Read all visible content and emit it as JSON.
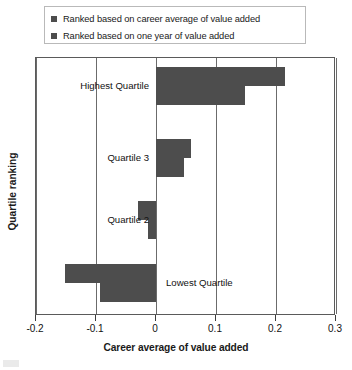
{
  "legend": {
    "items": [
      {
        "label": "Ranked based on career average of value added",
        "color": "#4d4d4d",
        "key": "career_average"
      },
      {
        "label": "Ranked based on one year of value added",
        "color": "#4d4d4d",
        "key": "one_year"
      }
    ]
  },
  "axes": {
    "x_title": "Career average of value added",
    "y_title": "Quartile ranking",
    "x_ticks": [
      "-0.2",
      "-0.1",
      "0",
      "0.1",
      "0.2",
      "0.3"
    ]
  },
  "chart_data": {
    "type": "bar",
    "orientation": "horizontal",
    "title": "",
    "xlabel": "Career average of value added",
    "ylabel": "Quartile ranking",
    "categories": [
      "Highest Quartile",
      "Quartile 3",
      "Quartile 2",
      "Lowest Quartile"
    ],
    "series": [
      {
        "name": "Ranked based on career average of value added",
        "color": "#4d4d4d",
        "values": [
          0.215,
          0.058,
          -0.03,
          -0.152
        ]
      },
      {
        "name": "Ranked based on one year of value added",
        "color": "#4d4d4d",
        "values": [
          0.148,
          0.047,
          -0.014,
          -0.094
        ]
      }
    ],
    "xlim": [
      -0.2,
      0.3
    ],
    "xtick_values": [
      -0.2,
      -0.1,
      0,
      0.1,
      0.2,
      0.3
    ],
    "xtick_labels": [
      "-0.2",
      "-0.1",
      "0",
      "0.1",
      "0.2",
      "0.3"
    ],
    "grid": "vertical gridlines at each x tick",
    "legend_position": "top"
  }
}
